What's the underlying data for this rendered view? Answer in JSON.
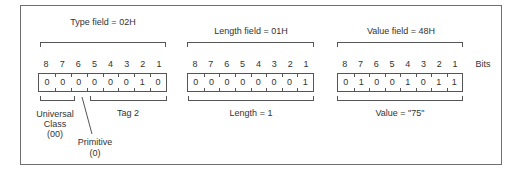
{
  "diagram": {
    "bits_label": "Bits",
    "bit_numbers": [
      "8",
      "7",
      "6",
      "5",
      "4",
      "3",
      "2",
      "1"
    ],
    "fields": [
      {
        "id": "type",
        "title": "Type field = 02H",
        "bits": [
          "0",
          "0",
          "0",
          "0",
          "0",
          "0",
          "1",
          "0"
        ],
        "annotations": {
          "class_label": [
            "Universal",
            "Class",
            "(00)"
          ],
          "primitive_label": [
            "Primitive",
            "(0)"
          ],
          "tag_label": "Tag 2"
        }
      },
      {
        "id": "length",
        "title": "Length field = 01H",
        "bits": [
          "0",
          "0",
          "0",
          "0",
          "0",
          "0",
          "0",
          "1"
        ],
        "annotations": {
          "caption": "Length = 1"
        }
      },
      {
        "id": "value",
        "title": "Value field = 48H",
        "bits": [
          "0",
          "1",
          "0",
          "0",
          "1",
          "0",
          "1",
          "1"
        ],
        "annotations": {
          "caption": "Value = \"75\""
        }
      }
    ]
  }
}
